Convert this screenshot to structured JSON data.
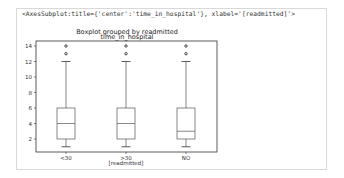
{
  "output": {
    "repr_text": "<AxesSubplot:title={'center':'time_in_hospital'}, xlabel='[readmitted]'>"
  },
  "chart_data": {
    "type": "boxplot",
    "title": "Boxplot grouped by readmitted",
    "subtitle": "time_in_hospital",
    "xlabel": "[readmitted]",
    "ylabel": "",
    "categories": [
      "<30",
      ">30",
      "NO"
    ],
    "ylim": [
      0.5,
      14.5
    ],
    "yticks": [
      2,
      4,
      6,
      8,
      10,
      12,
      14
    ],
    "grid": false,
    "legend": null,
    "boxes": [
      {
        "name": "<30",
        "whisker_low": 1,
        "q1": 2,
        "median": 4,
        "q3": 6,
        "whisker_high": 12,
        "outliers": [
          13,
          14
        ]
      },
      {
        "name": ">30",
        "whisker_low": 1,
        "q1": 2,
        "median": 4,
        "q3": 6,
        "whisker_high": 12,
        "outliers": [
          13,
          14
        ]
      },
      {
        "name": "NO",
        "whisker_low": 1,
        "q1": 2,
        "median": 3,
        "q3": 6,
        "whisker_high": 12,
        "outliers": [
          13,
          14
        ]
      }
    ]
  },
  "colors": {
    "box": "#555555",
    "frame": "#333333",
    "outlier": "#333333"
  }
}
